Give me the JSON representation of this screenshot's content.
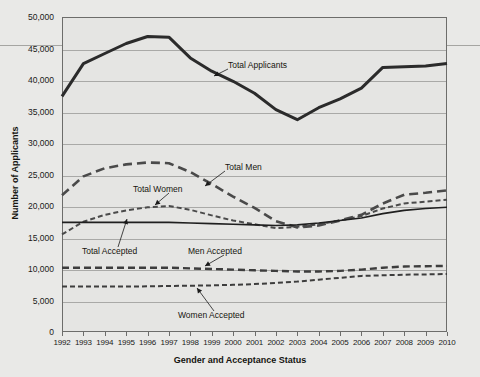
{
  "chart_data": {
    "type": "line",
    "title": "",
    "xlabel": "Gender and Acceptance Status",
    "ylabel": "Number of Applicants",
    "x": [
      1992,
      1993,
      1994,
      1995,
      1996,
      1997,
      1998,
      1999,
      2000,
      2001,
      2002,
      2003,
      2004,
      2005,
      2006,
      2007,
      2008,
      2009,
      2010
    ],
    "xlim": [
      1992,
      2010
    ],
    "ylim": [
      0,
      50000
    ],
    "yticks": [
      0,
      5000,
      10000,
      15000,
      20000,
      25000,
      30000,
      35000,
      40000,
      45000,
      50000
    ],
    "ytick_labels": [
      "0",
      "5,000",
      "10,000",
      "15,000",
      "20,000",
      "25,000",
      "30,000",
      "35,000",
      "40,000",
      "45,000",
      "50,000"
    ],
    "xtick_labels": [
      "1992",
      "1993",
      "1994",
      "1995",
      "1996",
      "1997",
      "1998",
      "1999",
      "2000",
      "2001",
      "2002",
      "2003",
      "2004",
      "2005",
      "2006",
      "2007",
      "2008",
      "2009",
      "2010"
    ],
    "grid": true,
    "legend_position": "inline-annotations",
    "series": [
      {
        "name": "Total Applicants",
        "style": "solid-thick",
        "color": "#2b2b2b",
        "values": [
          37400,
          42600,
          44200,
          45800,
          46900,
          46800,
          43500,
          41400,
          39800,
          37900,
          35300,
          33700,
          35600,
          37000,
          38700,
          42000,
          42100,
          42200,
          42600
        ]
      },
      {
        "name": "Total Men",
        "style": "long-dash",
        "color": "#4a4a4a",
        "values": [
          21700,
          24700,
          26000,
          26600,
          26900,
          26800,
          25400,
          23500,
          21500,
          19700,
          17600,
          16600,
          16900,
          17700,
          18600,
          20400,
          21800,
          22100,
          22500
        ]
      },
      {
        "name": "Total Women",
        "style": "short-dash",
        "color": "#4a4a4a",
        "values": [
          15500,
          17500,
          18600,
          19300,
          19800,
          20000,
          19400,
          18500,
          17700,
          17100,
          16500,
          16700,
          17100,
          17700,
          18400,
          19600,
          20400,
          20700,
          21000
        ]
      },
      {
        "name": "Total Accepted",
        "style": "solid-thin",
        "color": "#1f1f1f",
        "values": [
          17400,
          17400,
          17400,
          17400,
          17400,
          17400,
          17300,
          17200,
          17100,
          17000,
          16900,
          17000,
          17300,
          17700,
          18100,
          18800,
          19300,
          19600,
          19800
        ]
      },
      {
        "name": "Men Accepted",
        "style": "medium-dash",
        "color": "#3d3d3d",
        "values": [
          10200,
          10200,
          10200,
          10200,
          10200,
          10200,
          10100,
          10000,
          9900,
          9800,
          9700,
          9600,
          9600,
          9700,
          9900,
          10200,
          10400,
          10450,
          10500
        ]
      },
      {
        "name": "Women Accepted",
        "style": "fine-dash",
        "color": "#3d3d3d",
        "values": [
          7200,
          7200,
          7200,
          7200,
          7250,
          7300,
          7350,
          7400,
          7500,
          7600,
          7800,
          8000,
          8300,
          8600,
          8900,
          9000,
          9100,
          9150,
          9200
        ]
      }
    ],
    "annotations": [
      {
        "text": "Total Applicants",
        "label_x": 228,
        "label_y": 60,
        "point_x": 214,
        "point_y": 76
      },
      {
        "text": "Total Men",
        "total_key": "men",
        "label_x": 225,
        "label_y": 162,
        "point_x": 205,
        "point_y": 186
      },
      {
        "text": "Total Women",
        "total_key": "women",
        "label_x": 133,
        "label_y": 184,
        "point_x": 155,
        "point_y": 205
      },
      {
        "text": "Total Accepted",
        "label_x": 82,
        "label_y": 246,
        "point_x": 127,
        "point_y": 219
      },
      {
        "text": "Men Accepted",
        "label_x": 188,
        "label_y": 246,
        "point_x": 205,
        "point_y": 266
      },
      {
        "text": "Women Accepted",
        "label_x": 178,
        "label_y": 310,
        "point_x": 197,
        "point_y": 288
      }
    ]
  }
}
